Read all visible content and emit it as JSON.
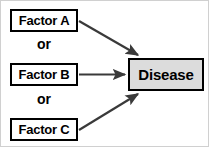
{
  "diagram": {
    "nodes": {
      "factor_a": {
        "label": "Factor A",
        "fill": "#ffffff",
        "stroke": "#000000"
      },
      "factor_b": {
        "label": "Factor B",
        "fill": "#ffffff",
        "stroke": "#000000"
      },
      "factor_c": {
        "label": "Factor C",
        "fill": "#ffffff",
        "stroke": "#000000"
      },
      "outcome": {
        "label": "Disease",
        "fill": "#dcdcdc",
        "stroke": "#000000"
      }
    },
    "connectors": [
      {
        "label": "or"
      },
      {
        "label": "or"
      }
    ],
    "edges": [
      {
        "from": "Factor A",
        "to": "Disease",
        "direction": "down-right",
        "arrowhead": "filled-triangle",
        "color": "#3a3a3a"
      },
      {
        "from": "Factor B",
        "to": "Disease",
        "direction": "horizontal",
        "arrowhead": "filled-triangle",
        "color": "#3a3a3a"
      },
      {
        "from": "Factor C",
        "to": "Disease",
        "direction": "up-right",
        "arrowhead": "filled-triangle",
        "color": "#3a3a3a"
      }
    ],
    "colors": {
      "line": "#3a3a3a",
      "border": "#000000",
      "outcome_fill": "#dcdcdc",
      "frame": "#d0d0d0"
    }
  }
}
